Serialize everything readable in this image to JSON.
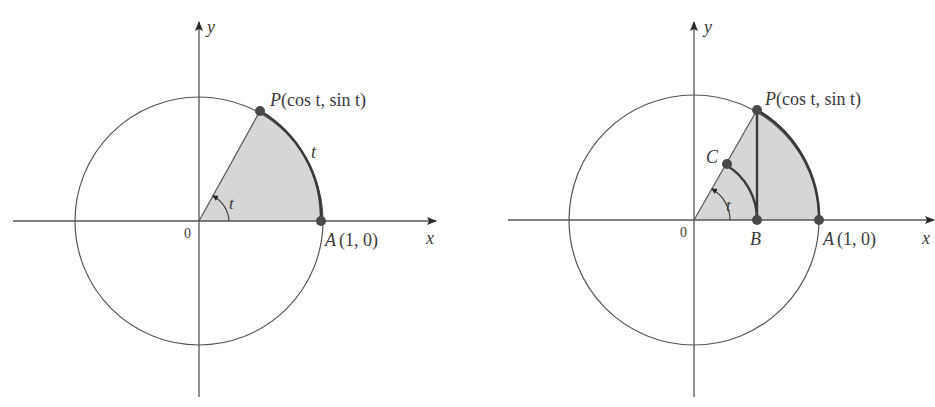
{
  "figure": {
    "colors": {
      "line": "#3a3a3a",
      "thin_line": "#555555",
      "shade": "#d6d6d6",
      "point": "#4a4a4a",
      "background": "#ffffff"
    },
    "left_panel": {
      "axis_x_label": "x",
      "axis_y_label": "y",
      "origin_label": "0",
      "point_p_label": "P(cos t, sin t)",
      "point_p_name": "P",
      "point_p_coords": "(cos t, sin t)",
      "point_a_name": "A",
      "point_a_coords": "(1, 0)",
      "arc_label": "t",
      "angle_label": "t"
    },
    "right_panel": {
      "axis_x_label": "x",
      "axis_y_label": "y",
      "origin_label": "0",
      "point_p_name": "P",
      "point_p_coords": "(cos t, sin t)",
      "point_a_name": "A",
      "point_a_coords": "(1, 0)",
      "point_b_name": "B",
      "point_c_name": "C",
      "angle_label": "t"
    }
  }
}
